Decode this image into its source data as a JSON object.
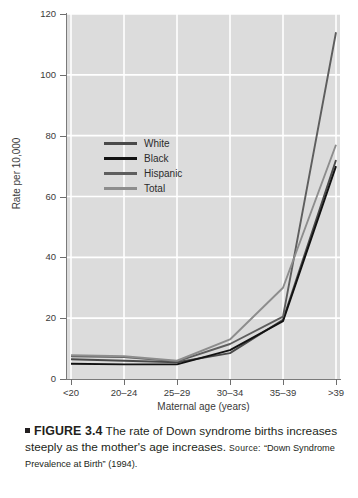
{
  "chart_data": {
    "type": "line",
    "title": "",
    "xlabel": "Maternal age (years)",
    "ylabel": "Rate per 10,000",
    "categories": [
      "<20",
      "20–24",
      "25–29",
      "30–34",
      "35–39",
      ">39"
    ],
    "ylim": [
      0,
      120
    ],
    "yticks": [
      0,
      20,
      40,
      60,
      80,
      100,
      120
    ],
    "grid": true,
    "legend_position": "inside-upper-left",
    "plot_background": "#dcdcdc",
    "gridline_color": "#ffffff",
    "series": [
      {
        "name": "White",
        "color": "#4a4a4a",
        "values": [
          6.5,
          6.0,
          5.5,
          8.5,
          19.5,
          72
        ]
      },
      {
        "name": "Black",
        "color": "#121212",
        "values": [
          5.0,
          4.8,
          4.8,
          9.5,
          19.0,
          70
        ]
      },
      {
        "name": "Hispanic",
        "color": "#5e5e5e",
        "values": [
          7.5,
          7.2,
          5.8,
          11.5,
          20.5,
          114
        ]
      },
      {
        "name": "Total",
        "color": "#8d8d8d",
        "values": [
          7.8,
          7.5,
          6.0,
          13.0,
          30.0,
          77
        ]
      }
    ]
  },
  "legend": {
    "items": [
      {
        "label": "White"
      },
      {
        "label": "Black"
      },
      {
        "label": "Hispanic"
      },
      {
        "label": "Total"
      }
    ]
  },
  "caption": {
    "figure_number": "FIGURE 3.4",
    "text": "The rate of Down syndrome births increases steeply as the mother's age increases.",
    "source_label": "Source:",
    "source_text": "“Down Syndrome Prevalence at Birth” (1994)."
  }
}
